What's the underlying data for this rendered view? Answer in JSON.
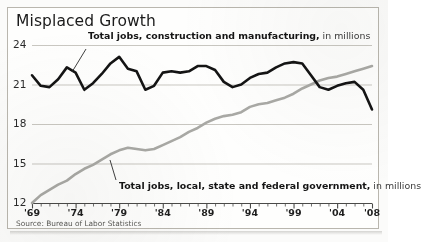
{
  "chart_data": {
    "type": "line",
    "title": "Misplaced Growth",
    "xlabel": "",
    "ylabel": "",
    "ylim": [
      12,
      24
    ],
    "xlim": [
      1969,
      2008
    ],
    "yticks": [
      24,
      21,
      18,
      15,
      12
    ],
    "ytick_labels": [
      "24",
      "21",
      "18",
      "15",
      "12"
    ],
    "xticks": [
      1969,
      1974,
      1979,
      1984,
      1989,
      1994,
      1999,
      2004,
      2008
    ],
    "xtick_labels": [
      "'69",
      "'74",
      "'79",
      "'84",
      "'89",
      "'94",
      "'99",
      "'04",
      "'08"
    ],
    "grid": true,
    "legend": "inline-annotations",
    "source": "Source: Bureau of Labor Statistics",
    "series": [
      {
        "name": "Total jobs, construction and manufacturing, in millions",
        "label_bold": "Total jobs, construction and manufacturing,",
        "label_light": " in millions",
        "color": "#141414",
        "width": 2.6,
        "x": [
          1969,
          1970,
          1971,
          1972,
          1973,
          1974,
          1975,
          1976,
          1977,
          1978,
          1979,
          1980,
          1981,
          1982,
          1983,
          1984,
          1985,
          1986,
          1987,
          1988,
          1989,
          1990,
          1991,
          1992,
          1993,
          1994,
          1995,
          1996,
          1997,
          1998,
          1999,
          2000,
          2001,
          2002,
          2003,
          2004,
          2005,
          2006,
          2007,
          2008
        ],
        "values": [
          21.7,
          20.9,
          20.8,
          21.4,
          22.3,
          21.9,
          20.6,
          21.1,
          21.8,
          22.6,
          23.1,
          22.2,
          22.0,
          20.6,
          20.9,
          21.9,
          22.0,
          21.9,
          22.0,
          22.4,
          22.4,
          22.1,
          21.2,
          20.8,
          21.0,
          21.5,
          21.8,
          21.9,
          22.3,
          22.6,
          22.7,
          22.6,
          21.7,
          20.8,
          20.6,
          20.9,
          21.1,
          21.2,
          20.6,
          19.1
        ]
      },
      {
        "name": "Total jobs, local, state and federal government, in millions",
        "label_bold": "Total jobs, local, state and federal government,",
        "label_light": " in millions",
        "color": "#a9a9a5",
        "width": 2.6,
        "x": [
          1969,
          1970,
          1971,
          1972,
          1973,
          1974,
          1975,
          1976,
          1977,
          1978,
          1979,
          1980,
          1981,
          1982,
          1983,
          1984,
          1985,
          1986,
          1987,
          1988,
          1989,
          1990,
          1991,
          1992,
          1993,
          1994,
          1995,
          1996,
          1997,
          1998,
          1999,
          2000,
          2001,
          2002,
          2003,
          2004,
          2005,
          2006,
          2007,
          2008
        ],
        "values": [
          12.0,
          12.6,
          13.0,
          13.4,
          13.7,
          14.2,
          14.6,
          14.9,
          15.3,
          15.7,
          16.0,
          16.2,
          16.1,
          16.0,
          16.1,
          16.4,
          16.7,
          17.0,
          17.4,
          17.7,
          18.1,
          18.4,
          18.6,
          18.7,
          18.9,
          19.3,
          19.5,
          19.6,
          19.8,
          20.0,
          20.3,
          20.7,
          21.0,
          21.3,
          21.5,
          21.6,
          21.8,
          22.0,
          22.2,
          22.4
        ]
      }
    ]
  },
  "labels": {
    "top_series_bold": "Total jobs, construction and manufacturing,",
    "top_series_light": " in millions",
    "bottom_series_bold": "Total jobs, local, state and federal government,",
    "bottom_series_light": " in millions"
  }
}
